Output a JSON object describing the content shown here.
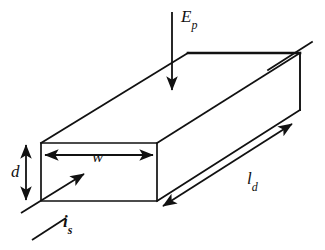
{
  "figure": {
    "shape": "rectangular-parallelepiped",
    "stroke_color": "#111111",
    "background_color": "#ffffff"
  },
  "labels": {
    "incident_power": {
      "base": "E",
      "sub": "p",
      "text": "Ep"
    },
    "width": {
      "base": "w",
      "sub": "",
      "text": "w"
    },
    "depth": {
      "base": "d",
      "sub": "",
      "text": "d"
    },
    "length": {
      "base": "l",
      "sub": "d",
      "text": "ld"
    },
    "source_current": {
      "base": "i",
      "sub": "s",
      "text": "is"
    }
  },
  "annotations": {
    "incident_power_arrow": {
      "name": "downward-arrow",
      "direction": "down",
      "heads": 1
    },
    "width_dimension": {
      "name": "double-arrow",
      "direction": "horizontal",
      "heads": 2
    },
    "depth_dimension": {
      "name": "double-arrow",
      "direction": "vertical",
      "heads": 2
    },
    "length_dimension": {
      "name": "double-arrow",
      "direction": "diagonal",
      "heads": 2
    },
    "source_current_arrow": {
      "name": "diagonal-arrow",
      "direction": "up-right",
      "heads": 1
    }
  },
  "geometry": {
    "front_face": {
      "x1": 41,
      "y1": 143,
      "x2": 157,
      "y2": 201
    },
    "top_back_edge": {
      "x1": 188,
      "y1": 53,
      "x2": 300,
      "y2": 53
    },
    "right_edge": {
      "x1": 300,
      "y1": 53,
      "x2": 300,
      "y2": 110
    },
    "depth_offset": {
      "dx": 147,
      "dy": -90
    }
  }
}
